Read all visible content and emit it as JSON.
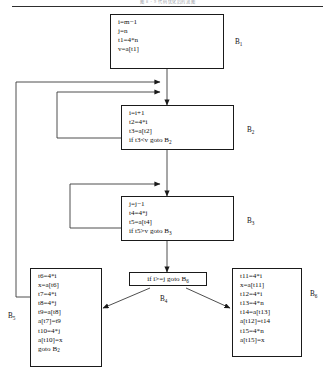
{
  "page": {
    "running_head": "图 8 - 9  代码优化后的流图",
    "width": 335,
    "height": 379,
    "ink_color": "#1a1a1a",
    "paper_color": "#ffffff"
  },
  "diagram": {
    "type": "control-flow-graph",
    "blocks": [
      {
        "id": "B1",
        "tag": "B",
        "tag_sub": "1",
        "shape": "rect",
        "lines": [
          "i=m−1",
          "j=n",
          "t1=4*n",
          "v=a[t1]"
        ]
      },
      {
        "id": "B2",
        "tag": "B",
        "tag_sub": "2",
        "shape": "rect",
        "lines": [
          "i=i+1",
          "t2=4*i",
          "t3=a[t2]",
          "if t3<v goto B",
          "2"
        ]
      },
      {
        "id": "B3",
        "tag": "B",
        "tag_sub": "3",
        "shape": "rect",
        "lines": [
          "j=j−1",
          "t4=4*j",
          "t5=a[t4]",
          "if t5>v goto B",
          "3"
        ]
      },
      {
        "id": "B4",
        "tag": "B",
        "tag_sub": "4",
        "shape": "rect-decision",
        "lines": [
          "if i>=j goto B",
          "6"
        ]
      },
      {
        "id": "B5",
        "tag": "B",
        "tag_sub": "5",
        "shape": "rect",
        "lines": [
          "t6=4*i",
          "x=a[t6]",
          "t7=4*i",
          "t8=4*j",
          "t9=a[t8]",
          "a[t7]=t9",
          "t10=4*j",
          "a[t10]=x",
          "goto B",
          "2"
        ]
      },
      {
        "id": "B6",
        "tag": "B",
        "tag_sub": "6",
        "shape": "rect",
        "lines": [
          "t11=4*i",
          "x=a[t11]",
          "t12=4*i",
          "t13=4*n",
          "t14=a[t13]",
          "a[t12]=t14",
          "t15=4*n",
          "a[t15]=x"
        ]
      }
    ],
    "block_1": {
      "line_1": "i=m−1",
      "line_2": "j=n",
      "line_3": "t1=4*n",
      "line_4": "v=a[t1]",
      "tag": "B",
      "tag_sub": "1"
    },
    "block_2": {
      "line_1": "i=i+1",
      "line_2": "t2=4*i",
      "line_3": "t3=a[t2]",
      "line_4_pre": "if t3<v goto B",
      "line_4_sub": "2",
      "tag": "B",
      "tag_sub": "2"
    },
    "block_3": {
      "line_1": "j=j−1",
      "line_2": "t4=4*j",
      "line_3": "t5=a[t4]",
      "line_4_pre": "if t5>v goto B",
      "line_4_sub": "3",
      "tag": "B",
      "tag_sub": "3"
    },
    "block_4": {
      "line_1_pre": "if i>=j goto B",
      "line_1_sub": "6",
      "tag": "B",
      "tag_sub": "4"
    },
    "block_5": {
      "line_1": "t6=4*i",
      "line_2": "x=a[t6]",
      "line_3": "t7=4*i",
      "line_4": "t8=4*j",
      "line_5": "t9=a[t8]",
      "line_6": "a[t7]=t9",
      "line_7": "t10=4*j",
      "line_8": "a[t10]=x",
      "line_9_pre": "goto B",
      "line_9_sub": "2",
      "tag": "B",
      "tag_sub": "5"
    },
    "block_6": {
      "line_1": "t11=4*i",
      "line_2": "x=a[t11]",
      "line_3": "t12=4*i",
      "line_4": "t13=4*n",
      "line_5": "t14=a[t13]",
      "line_6": "a[t12]=t14",
      "line_7": "t15=4*n",
      "line_8": "a[t15]=x",
      "tag": "B",
      "tag_sub": "6"
    },
    "edges": [
      {
        "from": "B1",
        "to": "B2",
        "style": "straight-down-arrow"
      },
      {
        "from": "B2",
        "to": "B3",
        "style": "straight-down-arrow"
      },
      {
        "from": "B3",
        "to": "B4",
        "style": "straight-down-arrow"
      },
      {
        "from": "B2",
        "to": "B2",
        "style": "left-loopback-arrow"
      },
      {
        "from": "B3",
        "to": "B3",
        "style": "left-loopback-arrow"
      },
      {
        "from": "B4",
        "to": "B5",
        "style": "diagonal-arrow-left"
      },
      {
        "from": "B4",
        "to": "B6",
        "style": "diagonal-arrow-right"
      },
      {
        "from": "B5",
        "to": "B2",
        "style": "far-left-loopback-arrow"
      }
    ]
  }
}
